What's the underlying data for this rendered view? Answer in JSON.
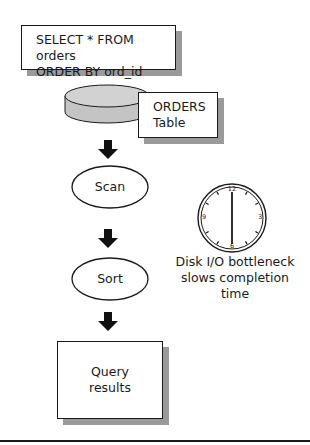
{
  "diagram": {
    "query_box": {
      "line1": "SELECT * FROM orders",
      "line2": "ORDER BY ord_id"
    },
    "table_box": {
      "line1": "ORDERS",
      "line2": "Table"
    },
    "steps": [
      {
        "label": "Scan"
      },
      {
        "label": "Sort"
      }
    ],
    "result_box": {
      "line1": "Query",
      "line2": "results"
    },
    "clock": {
      "numbers": [
        "12",
        "3",
        "6",
        "9"
      ]
    },
    "annotation": {
      "line1": "Disk I/O bottleneck",
      "line2": "slows completion time"
    },
    "colors": {
      "stroke": "#1a1a1a",
      "shadow": "#9a9a9a",
      "cylinder": "#c8c8c8",
      "cylinder_top": "#d4d4d4"
    }
  }
}
